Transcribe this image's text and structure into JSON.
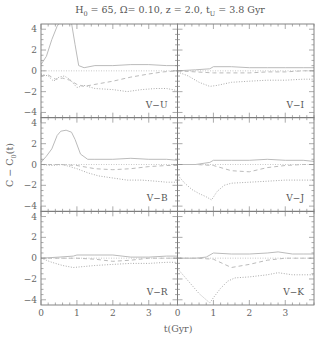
{
  "chart_data": {
    "type": "line",
    "title": "H0 = 65, Ω= 0.10, z = 2.0, tU = 3.8 Gyr",
    "title_parts": {
      "h0": "H",
      "h0_sub": "0",
      "h0_val": " = 65, Ω= 0.10, z = 2.0, t",
      "tu_sub": "U",
      "tu_val": " = 3.8 Gyr"
    },
    "xlabel": "t(Gyr)",
    "ylabel": "C − C0(t)",
    "ylabel_parts": {
      "main": "C − C",
      "sub": "0",
      "tail": "(t)"
    },
    "xlim": [
      0,
      3.8
    ],
    "ylim": [
      -4.5,
      4.5
    ],
    "xticks": [
      0,
      1,
      2,
      3
    ],
    "yticks": [
      -4,
      -2,
      0,
      2,
      4
    ],
    "grid": false,
    "layout": {
      "rows": 3,
      "cols": 2,
      "shared_axes": true
    },
    "series_styles": [
      "solid",
      "dotted",
      "dashed"
    ],
    "panels": [
      {
        "label": "V−U",
        "row": 0,
        "col": 0,
        "series": [
          {
            "style": "solid",
            "x": [
              0,
              0.15,
              0.3,
              0.45,
              0.55,
              0.7,
              0.85,
              0.95,
              1.05,
              1.2,
              1.5,
              2.0,
              2.5,
              3.0,
              3.5,
              3.8
            ],
            "y": [
              0.6,
              1.4,
              3.0,
              4.3,
              4.8,
              5.0,
              4.6,
              2.5,
              0.5,
              0.3,
              0.5,
              0.5,
              0.6,
              0.6,
              0.5,
              0.5
            ]
          },
          {
            "style": "dotted",
            "x": [
              0,
              0.2,
              0.35,
              0.5,
              0.65,
              0.8,
              1.0,
              1.2,
              1.5,
              2.0,
              2.4,
              2.8,
              3.2,
              3.5,
              3.8
            ],
            "y": [
              -0.3,
              -0.5,
              -1.0,
              -0.6,
              -0.5,
              -0.8,
              -1.6,
              -1.4,
              -1.7,
              -1.8,
              -2.0,
              -1.8,
              -1.7,
              -1.7,
              -1.9
            ]
          },
          {
            "style": "dashed",
            "x": [
              0,
              0.2,
              0.4,
              0.6,
              0.8,
              1.0,
              1.2,
              1.5,
              2.0,
              2.5,
              3.0,
              3.4,
              3.8
            ],
            "y": [
              -0.5,
              -0.4,
              -0.8,
              -0.7,
              -0.9,
              -1.3,
              -1.5,
              -1.3,
              -1.0,
              -0.6,
              -0.3,
              -0.1,
              0.0
            ]
          }
        ]
      },
      {
        "label": "V−I",
        "row": 0,
        "col": 1,
        "series": [
          {
            "style": "solid",
            "x": [
              0,
              0.5,
              0.9,
              1.0,
              1.5,
              2.0,
              2.5,
              3.0,
              3.5,
              3.8
            ],
            "y": [
              0.0,
              0.1,
              0.2,
              0.4,
              0.4,
              0.3,
              0.3,
              0.3,
              0.3,
              0.3
            ]
          },
          {
            "style": "dotted",
            "x": [
              0,
              0.3,
              0.6,
              0.9,
              1.1,
              1.5,
              2.0,
              2.5,
              3.0,
              3.5,
              3.8
            ],
            "y": [
              -0.1,
              -0.5,
              -1.1,
              -1.5,
              -1.4,
              -1.1,
              -1.0,
              -0.9,
              -0.9,
              -0.8,
              -0.8
            ]
          },
          {
            "style": "dashed",
            "x": [
              0,
              0.5,
              1.0,
              1.5,
              2.0,
              2.5,
              3.0,
              3.5,
              3.8
            ],
            "y": [
              0.0,
              -0.1,
              -0.2,
              -0.2,
              -0.2,
              -0.1,
              -0.1,
              0.0,
              0.0
            ]
          }
        ]
      },
      {
        "label": "V−B",
        "row": 1,
        "col": 0,
        "series": [
          {
            "style": "solid",
            "x": [
              0,
              0.15,
              0.3,
              0.45,
              0.55,
              0.7,
              0.85,
              0.95,
              1.1,
              1.3,
              1.5,
              2.0,
              2.5,
              3.0,
              3.5,
              3.8
            ],
            "y": [
              0.2,
              0.8,
              1.5,
              2.8,
              3.2,
              3.3,
              3.1,
              2.4,
              1.0,
              0.5,
              0.5,
              0.5,
              0.6,
              0.5,
              0.5,
              0.4
            ]
          },
          {
            "style": "dotted",
            "x": [
              0,
              0.3,
              0.6,
              0.8,
              1.0,
              1.3,
              1.6,
              2.0,
              2.4,
              2.8,
              3.2,
              3.5,
              3.8
            ],
            "y": [
              0.0,
              -0.1,
              0.0,
              -0.2,
              -0.4,
              -0.8,
              -1.1,
              -1.3,
              -1.5,
              -1.5,
              -1.6,
              -1.7,
              -1.7
            ]
          },
          {
            "style": "dashed",
            "x": [
              0,
              0.5,
              1.0,
              1.5,
              2.0,
              2.5,
              3.0,
              3.5,
              3.8
            ],
            "y": [
              0.0,
              0.0,
              -0.1,
              -0.4,
              -0.5,
              -0.4,
              -0.2,
              -0.1,
              -0.1
            ]
          }
        ]
      },
      {
        "label": "V−J",
        "row": 1,
        "col": 1,
        "series": [
          {
            "style": "solid",
            "x": [
              0,
              0.5,
              0.9,
              1.0,
              1.5,
              2.0,
              2.5,
              3.0,
              3.5,
              3.8
            ],
            "y": [
              0.0,
              0.0,
              0.2,
              0.4,
              0.4,
              0.4,
              0.5,
              0.4,
              0.4,
              0.3
            ]
          },
          {
            "style": "dotted",
            "x": [
              0,
              0.2,
              0.4,
              0.6,
              0.8,
              0.95,
              1.1,
              1.3,
              1.5,
              2.0,
              2.5,
              3.0,
              3.5,
              3.8
            ],
            "y": [
              -1.0,
              -1.8,
              -2.4,
              -2.8,
              -3.1,
              -3.4,
              -2.6,
              -2.0,
              -1.8,
              -1.7,
              -1.6,
              -1.5,
              -1.5,
              -1.5
            ]
          },
          {
            "style": "dashed",
            "x": [
              0,
              0.5,
              1.0,
              1.5,
              2.0,
              2.5,
              3.0,
              3.5,
              3.8
            ],
            "y": [
              0.0,
              0.0,
              -0.1,
              -0.6,
              -0.7,
              -0.3,
              -0.1,
              0.0,
              0.0
            ]
          }
        ]
      },
      {
        "label": "V−R",
        "row": 2,
        "col": 0,
        "series": [
          {
            "style": "solid",
            "x": [
              0,
              0.5,
              0.9,
              1.0,
              1.5,
              2.0,
              2.5,
              3.0,
              3.5,
              3.8
            ],
            "y": [
              0.0,
              0.1,
              0.2,
              0.3,
              0.3,
              0.3,
              0.1,
              0.1,
              0.2,
              0.2
            ]
          },
          {
            "style": "dotted",
            "x": [
              0,
              0.3,
              0.6,
              0.9,
              1.2,
              1.5,
              2.0,
              2.5,
              3.0,
              3.5,
              3.8
            ],
            "y": [
              0.0,
              -0.4,
              -0.7,
              -0.9,
              -0.8,
              -0.7,
              -0.6,
              -0.5,
              -0.5,
              -0.4,
              -0.4
            ]
          },
          {
            "style": "dashed",
            "x": [
              0,
              0.5,
              1.0,
              1.5,
              2.0,
              2.5,
              3.0,
              3.5,
              3.8
            ],
            "y": [
              0.0,
              0.0,
              0.0,
              -0.1,
              -0.3,
              -0.2,
              0.0,
              0.0,
              0.0
            ]
          }
        ]
      },
      {
        "label": "V−K",
        "row": 2,
        "col": 1,
        "series": [
          {
            "style": "solid",
            "x": [
              0,
              0.5,
              0.8,
              1.0,
              1.5,
              2.0,
              2.5,
              2.8,
              3.2,
              3.5,
              3.8
            ],
            "y": [
              0.0,
              0.0,
              0.1,
              0.5,
              0.4,
              0.4,
              0.5,
              0.6,
              0.4,
              0.4,
              0.4
            ]
          },
          {
            "style": "dotted",
            "x": [
              0,
              0.2,
              0.4,
              0.6,
              0.8,
              0.9,
              1.0,
              1.2,
              1.4,
              1.6,
              2.0,
              2.5,
              2.8,
              3.2,
              3.5,
              3.8
            ],
            "y": [
              -1.0,
              -1.8,
              -2.6,
              -3.4,
              -4.0,
              -4.3,
              -3.8,
              -2.9,
              -2.2,
              -1.9,
              -1.8,
              -1.6,
              -1.4,
              -1.6,
              -1.6,
              -1.6
            ]
          },
          {
            "style": "dashed",
            "x": [
              0,
              0.5,
              1.0,
              1.5,
              2.0,
              2.5,
              3.0,
              3.5,
              3.8
            ],
            "y": [
              0.0,
              0.0,
              -0.1,
              -0.9,
              -0.6,
              -0.2,
              0.0,
              0.0,
              0.0
            ]
          }
        ]
      }
    ]
  },
  "colors": {
    "frame": "#777777",
    "curves": "#bbbbbb",
    "text": "#555555"
  }
}
